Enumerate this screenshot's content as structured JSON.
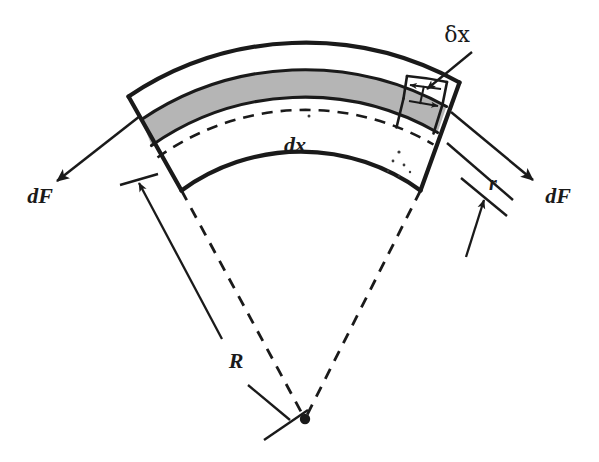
{
  "figure": {
    "background_color": "#ffffff",
    "ink_color": "#1a1a1a",
    "band_fill_color": "#b5b5b5"
  },
  "labels": {
    "delta_x": "δx",
    "dx": "dx",
    "r": "r",
    "R": "R",
    "dF_left": "dF",
    "dF_right": "dF"
  },
  "annotations": {
    "apex_marker": "center-of-curvature-dot",
    "neutral_axis": "dashed-arc",
    "shaded_band": "stressed-fibre-layer",
    "element_strip": "delta-x-strip"
  }
}
